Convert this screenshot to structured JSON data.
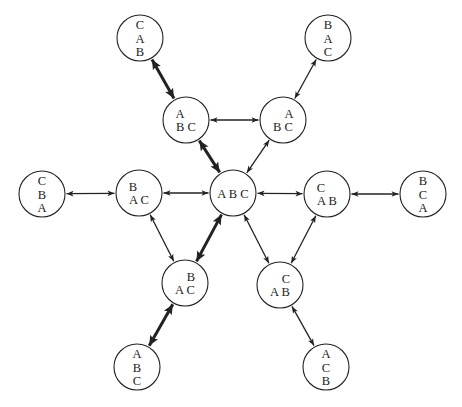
{
  "diagram": {
    "type": "state-transition-graph",
    "colors": {
      "stroke": "#222222",
      "fill": "#ffffff",
      "background": "#ffffff"
    },
    "node_radius": 23,
    "nodes": [
      {
        "id": "n_cab_top",
        "x": 140,
        "y": 38,
        "lines": [
          {
            "text": "C",
            "dx": 0
          },
          {
            "text": "A",
            "dx": 0
          },
          {
            "text": "B",
            "dx": 0
          }
        ],
        "label": "C/A/B"
      },
      {
        "id": "n_bac_top",
        "x": 328,
        "y": 38,
        "lines": [
          {
            "text": "B",
            "dx": 0
          },
          {
            "text": "A",
            "dx": 0
          },
          {
            "text": "C",
            "dx": 0
          }
        ],
        "label": "B/A/C"
      },
      {
        "id": "n_a_bc_l",
        "x": 186,
        "y": 120,
        "lines": [
          {
            "text": "A",
            "dx": -6
          },
          {
            "text": "B C",
            "dx": 0
          }
        ],
        "label": "A on B, C"
      },
      {
        "id": "n_a_bc_r",
        "x": 283,
        "y": 120,
        "lines": [
          {
            "text": "A",
            "dx": 6
          },
          {
            "text": "B C",
            "dx": 0
          }
        ],
        "label": "A on C, B"
      },
      {
        "id": "n_cba",
        "x": 42,
        "y": 194,
        "lines": [
          {
            "text": "C",
            "dx": 0
          },
          {
            "text": "B",
            "dx": 0
          },
          {
            "text": "A",
            "dx": 0
          }
        ],
        "label": "C/B/A"
      },
      {
        "id": "n_b_ac_l",
        "x": 139,
        "y": 193,
        "lines": [
          {
            "text": "B",
            "dx": -6
          },
          {
            "text": "A C",
            "dx": 0
          }
        ],
        "label": "B on A, C"
      },
      {
        "id": "n_abc",
        "x": 233,
        "y": 193,
        "lines": [
          {
            "text": "A B C",
            "dx": 0
          }
        ],
        "label": "A B C"
      },
      {
        "id": "n_c_ab_r",
        "x": 327,
        "y": 194,
        "lines": [
          {
            "text": "C",
            "dx": -6
          },
          {
            "text": "A B",
            "dx": 0
          }
        ],
        "label": "C on A, B"
      },
      {
        "id": "n_bca",
        "x": 423,
        "y": 194,
        "lines": [
          {
            "text": "B",
            "dx": 0
          },
          {
            "text": "C",
            "dx": 0
          },
          {
            "text": "A",
            "dx": 0
          }
        ],
        "label": "B/C/A"
      },
      {
        "id": "n_b_ac_low",
        "x": 185,
        "y": 283,
        "lines": [
          {
            "text": "B",
            "dx": 6
          },
          {
            "text": "A C",
            "dx": 0
          }
        ],
        "label": "B on C, A"
      },
      {
        "id": "n_c_ab_low",
        "x": 280,
        "y": 285,
        "lines": [
          {
            "text": "C",
            "dx": 6
          },
          {
            "text": "A B",
            "dx": 0
          }
        ],
        "label": "C on B, A"
      },
      {
        "id": "n_abc_bot",
        "x": 137,
        "y": 367,
        "lines": [
          {
            "text": "A",
            "dx": 0
          },
          {
            "text": "B",
            "dx": 0
          },
          {
            "text": "C",
            "dx": 0
          }
        ],
        "label": "A/B/C"
      },
      {
        "id": "n_acb_bot",
        "x": 326,
        "y": 367,
        "lines": [
          {
            "text": "A",
            "dx": 0
          },
          {
            "text": "C",
            "dx": 0
          },
          {
            "text": "B",
            "dx": 0
          }
        ],
        "label": "A/C/B"
      }
    ],
    "edges": [
      {
        "from": "n_cab_top",
        "to": "n_a_bc_l",
        "heavy": true
      },
      {
        "from": "n_bac_top",
        "to": "n_a_bc_r",
        "heavy": false
      },
      {
        "from": "n_a_bc_l",
        "to": "n_a_bc_r",
        "heavy": false
      },
      {
        "from": "n_a_bc_l",
        "to": "n_abc",
        "heavy": true
      },
      {
        "from": "n_a_bc_r",
        "to": "n_abc",
        "heavy": false
      },
      {
        "from": "n_cba",
        "to": "n_b_ac_l",
        "heavy": false
      },
      {
        "from": "n_b_ac_l",
        "to": "n_abc",
        "heavy": false
      },
      {
        "from": "n_abc",
        "to": "n_c_ab_r",
        "heavy": false
      },
      {
        "from": "n_c_ab_r",
        "to": "n_bca",
        "heavy": false
      },
      {
        "from": "n_b_ac_l",
        "to": "n_b_ac_low",
        "heavy": false
      },
      {
        "from": "n_abc",
        "to": "n_b_ac_low",
        "heavy": true
      },
      {
        "from": "n_abc",
        "to": "n_c_ab_low",
        "heavy": false
      },
      {
        "from": "n_c_ab_r",
        "to": "n_c_ab_low",
        "heavy": false
      },
      {
        "from": "n_b_ac_low",
        "to": "n_abc_bot",
        "heavy": true
      },
      {
        "from": "n_c_ab_low",
        "to": "n_acb_bot",
        "heavy": false
      }
    ]
  }
}
